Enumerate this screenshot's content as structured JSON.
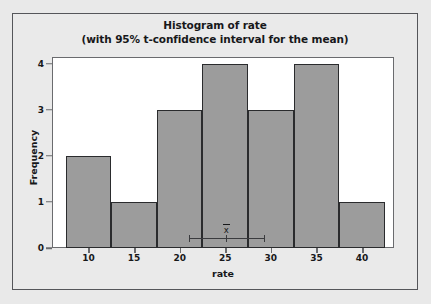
{
  "chart_data": {
    "type": "bar",
    "title": "Histogram of rate",
    "subtitle": "(with 95% t-confidence interval for the mean)",
    "xlabel": "rate",
    "ylabel": "Frequency",
    "grid": false,
    "legend": "none",
    "xlim": [
      6.0,
      43.5
    ],
    "ylim": [
      0,
      4.15
    ],
    "xticks": [
      10,
      15,
      20,
      25,
      30,
      35,
      40
    ],
    "xtick_labels": [
      "10",
      "15",
      "20",
      "25",
      "30",
      "35",
      "40"
    ],
    "yticks": [
      0,
      1,
      2,
      3,
      4
    ],
    "ytick_labels": [
      "0",
      "1",
      "2",
      "3",
      "4"
    ],
    "bin_width": 5,
    "bin_edges": [
      7.5,
      12.5,
      17.5,
      22.5,
      27.5,
      32.5,
      37.5,
      42.5
    ],
    "categories": [
      "7.5-12.5",
      "12.5-17.5",
      "17.5-22.5",
      "22.5-27.5",
      "27.5-32.5",
      "32.5-37.5",
      "37.5-42.5"
    ],
    "values": [
      2,
      1,
      3,
      4,
      3,
      4,
      1
    ],
    "bar_color": "#9c9c9c",
    "bar_edge_color": "#2a2b2d",
    "annotation": {
      "name": "t-confidence-interval",
      "confidence_level": "95%",
      "mean_symbol": "x",
      "mean": 25.1,
      "lower": 21.0,
      "upper": 29.2
    }
  },
  "figure": {
    "background_color": "#e9e9e9",
    "plot_background_color": "#ffffff",
    "frame_color": "#55565a"
  }
}
